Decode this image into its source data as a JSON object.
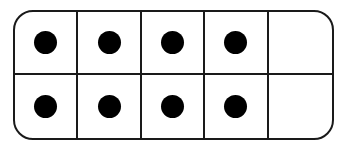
{
  "ten_frame": {
    "rows": 2,
    "columns": 5,
    "filled_count": 8,
    "empty_count": 2,
    "total_cells": 10,
    "cells": [
      [
        true,
        true,
        true,
        true,
        false
      ],
      [
        true,
        true,
        true,
        true,
        false
      ]
    ],
    "colors": {
      "border": "#1a1a1a",
      "dot": "#000000",
      "background": "#ffffff"
    }
  }
}
